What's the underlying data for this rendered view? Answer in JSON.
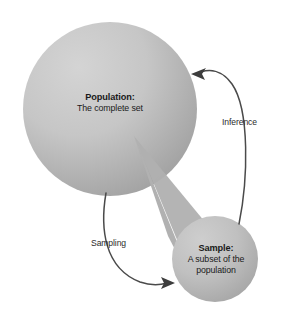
{
  "diagram": {
    "type": "concept-diagram",
    "title_text_absent": true,
    "nodes": [
      {
        "id": "population",
        "shape": "circle",
        "title": "Population:",
        "lines": [
          "The complete set"
        ],
        "center": {
          "x": 110,
          "y": 109
        },
        "radius": 87,
        "fill_light": "#cfcfcf",
        "fill_dark": "#a2a2a2"
      },
      {
        "id": "sample",
        "shape": "circle",
        "title": "Sample:",
        "lines": [
          "A subset of the",
          "population"
        ],
        "center": {
          "x": 215,
          "y": 259
        },
        "radius": 43,
        "fill_light": "#c9c9c9",
        "fill_dark": "#a5a5a5"
      }
    ],
    "connectors": [
      {
        "id": "sampling",
        "label": "Sampling",
        "from": "population",
        "to": "sample",
        "direction": "population-to-sample",
        "arrowhead": "right",
        "stroke": "#4a4a4a"
      },
      {
        "id": "inference",
        "label": "Inference",
        "from": "sample",
        "to": "population",
        "direction": "sample-to-population",
        "arrowhead": "left",
        "stroke": "#4a4a4a"
      }
    ],
    "cone": {
      "id": "magnification-cone",
      "description": "shaded wedge linking population to sample",
      "apex": {
        "x": 134,
        "y": 136
      },
      "fill": "#b2b2b2"
    },
    "colors": {
      "background": "#ffffff",
      "text": "#1a1a1a",
      "connector": "#4a4a4a",
      "circle_light": "#cfcfcf",
      "circle_dark": "#a2a2a2",
      "cone": "#b2b2b2"
    }
  }
}
